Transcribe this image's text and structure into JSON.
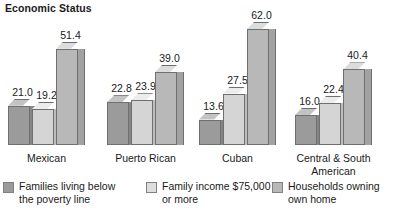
{
  "title": "Economic Status",
  "chart_data": {
    "type": "bar",
    "title": "Economic Status",
    "xlabel": "",
    "ylabel": "",
    "grid": false,
    "legend_position": "bottom",
    "ylim": [
      0,
      62
    ],
    "categories": [
      "Mexican",
      "Puerto Rican",
      "Cuban",
      "Central & South\nAmerican"
    ],
    "series": [
      {
        "name": "Families living below\nthe poverty line",
        "color": "#9b9b9b",
        "values": [
          21.0,
          22.8,
          13.6,
          16.0
        ],
        "labels": [
          "21.0",
          "22.8",
          "13.6",
          "16.0"
        ]
      },
      {
        "name": "Family income $75,000\nor more",
        "color": "#dedede",
        "values": [
          19.2,
          23.9,
          27.5,
          22.4
        ],
        "labels": [
          "19.2",
          "23.9",
          "27.5",
          "22.4"
        ]
      },
      {
        "name": "Households owning\nown home",
        "color": "#b8b8b8",
        "values": [
          51.4,
          39.0,
          62.0,
          40.4
        ],
        "labels": [
          "51.4",
          "39.0",
          "62.0",
          "40.4"
        ]
      }
    ]
  },
  "legend": {
    "items": [
      {
        "label": "Families living below\nthe poverty line",
        "swatch": "#9b9b9b"
      },
      {
        "label": "Family income $75,000\nor more",
        "swatch": "#dedede"
      },
      {
        "label": "Households owning\nown home",
        "swatch": "#b8b8b8"
      }
    ]
  }
}
